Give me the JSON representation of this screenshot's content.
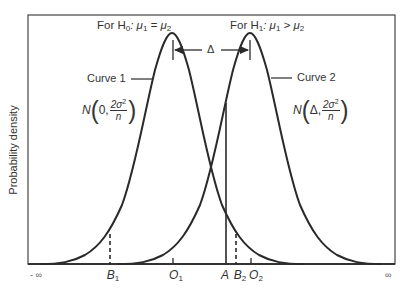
{
  "diagram": {
    "hypotheses": {
      "h0": {
        "prefix": "For H",
        "sub": "0",
        "rest": ": μ",
        "sub1": "1",
        "eq": " = μ",
        "sub2": "2"
      },
      "h1": {
        "prefix": "For H",
        "sub": "1",
        "rest": ": μ",
        "sub1": "1",
        "eq": " > μ",
        "sub2": "2"
      }
    },
    "delta_label": "Δ",
    "curves": [
      {
        "label": "Curve 1",
        "dist_N": "N",
        "mean": "0,",
        "var_num": "2σ",
        "var_exp": "2",
        "var_den": "n",
        "center_label": "O",
        "center_sub": "1"
      },
      {
        "label": "Curve 2",
        "dist_N": "N",
        "mean": "Δ,",
        "var_num": "2σ",
        "var_exp": "2",
        "var_den": "n",
        "center_label": "O",
        "center_sub": "2"
      }
    ],
    "y_axis_label": "Probability density",
    "x_axis": {
      "left_end": "- ∞",
      "right_end": "∞",
      "markers": [
        {
          "label": "B",
          "sub": "1"
        },
        {
          "label": "O",
          "sub": "1"
        },
        {
          "label": "A",
          "sub": ""
        },
        {
          "label": "B",
          "sub": "2"
        },
        {
          "label": "O",
          "sub": "2"
        }
      ]
    },
    "colors": {
      "line": "#2a2a2a",
      "frame": "#444444",
      "background": "#ffffff"
    }
  }
}
